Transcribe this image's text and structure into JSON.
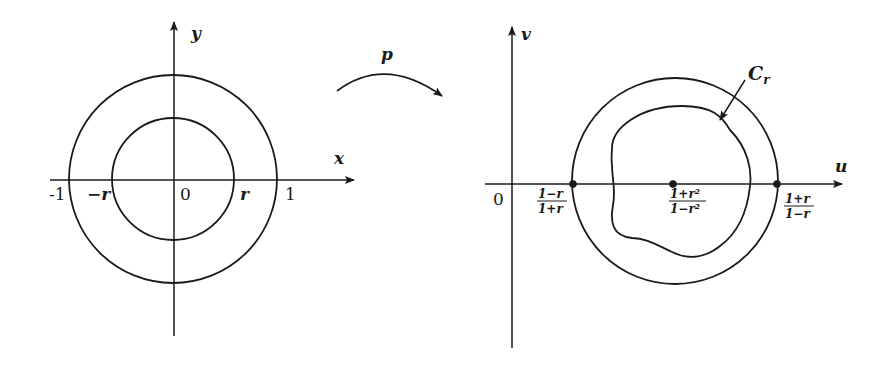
{
  "figure": {
    "left_panel": {
      "axes": {
        "x_label": "x",
        "y_label": "y"
      },
      "ticks": [
        "-1",
        "−r",
        "0",
        "r",
        "1"
      ],
      "regions": [
        {
          "name": "unit-circle",
          "radius_label": "1"
        },
        {
          "name": "disk-r",
          "radius_label": "r",
          "shaded": true
        }
      ]
    },
    "mapping": {
      "label": "p"
    },
    "right_panel": {
      "axes": {
        "x_label": "u",
        "y_label": "v"
      },
      "origin_label": "0",
      "points": [
        {
          "name": "left",
          "num": "1−r",
          "den": "1+r"
        },
        {
          "name": "center",
          "num": "1+r²",
          "den": "1−r²"
        },
        {
          "name": "right",
          "num": "1+r",
          "den": "1−r"
        }
      ],
      "curve_label": "C",
      "curve_subscript": "r"
    }
  }
}
